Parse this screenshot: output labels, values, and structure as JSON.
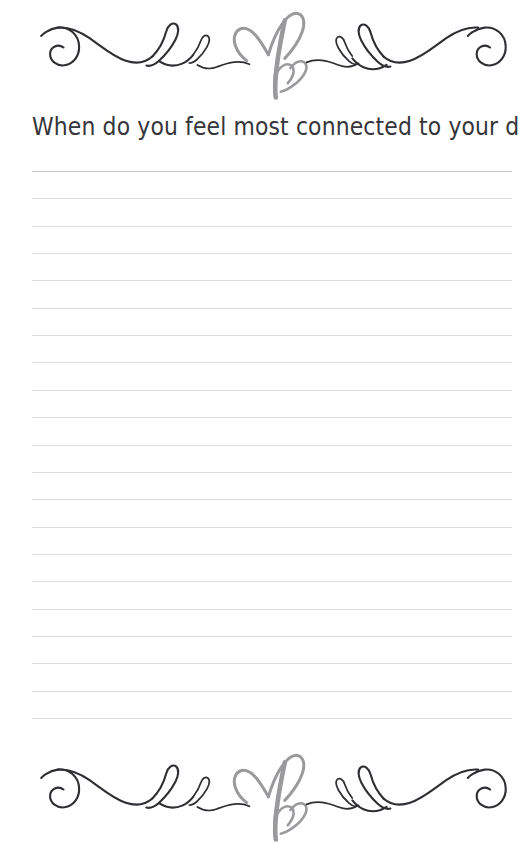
{
  "page": {
    "type": "journal-prompt-page",
    "background_color": "#ffffff",
    "width": 520,
    "height": 845
  },
  "prompt": {
    "title": "When do you feel most connected to your dad?",
    "text_color": "#35353a"
  },
  "ornaments": {
    "top": {
      "name": "decorative-flourish-divider",
      "swash_color": "#2e2e33",
      "heart_color": "#9a9a9d",
      "elements": [
        "left-spiral-curl",
        "wave",
        "tall-loop",
        "small-loop",
        "double-heart",
        "small-loop",
        "tall-loop",
        "wave",
        "right-spiral-curl"
      ]
    },
    "bottom": {
      "name": "decorative-flourish-divider",
      "swash_color": "#2e2e33",
      "heart_color": "#9a9a9d",
      "elements": [
        "left-spiral-curl",
        "wave",
        "tall-loop",
        "small-loop",
        "double-heart",
        "small-loop",
        "tall-loop",
        "wave",
        "right-spiral-curl"
      ]
    }
  },
  "writing_lines": {
    "count": 21,
    "first_line_y": 171,
    "spacing": 27.35,
    "left": 32,
    "right": 512,
    "color": "#dcdce0",
    "first_line_color": "#c6c6cc"
  }
}
